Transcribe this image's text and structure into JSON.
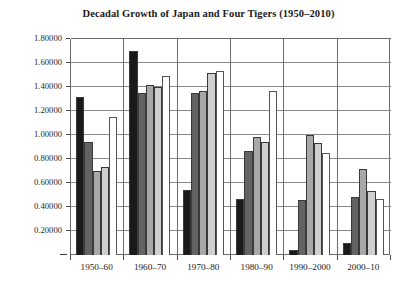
{
  "chart_data": {
    "type": "bar",
    "title": "Decadal Growth of Japan and Four Tigers (1950–2010)",
    "xlabel": "",
    "ylabel": "",
    "ylim": [
      0,
      1.8
    ],
    "grid": true,
    "legend_position": "none",
    "ytick_labels": [
      "1.80000",
      "1.60000",
      "1.40000",
      "1.20000",
      "1.00000",
      "0.80000",
      "0.60000",
      "0.40000",
      "0.20000",
      "–"
    ],
    "ytick_values": [
      1.8,
      1.6,
      1.4,
      1.2,
      1.0,
      0.8,
      0.6,
      0.4,
      0.2,
      0.0
    ],
    "categories": [
      "1950–60",
      "1960–70",
      "1970–80",
      "1980–90",
      "1990–2000",
      "2000–10"
    ],
    "series": [
      {
        "name": "series-1",
        "color": "#1a1a1a",
        "values": [
          1.32,
          1.7,
          0.54,
          0.47,
          0.04,
          0.1
        ]
      },
      {
        "name": "series-2",
        "color": "#636363",
        "values": [
          0.94,
          1.35,
          1.35,
          0.87,
          0.46,
          0.48
        ]
      },
      {
        "name": "series-3",
        "color": "#a8a8a8",
        "values": [
          0.7,
          1.42,
          1.37,
          0.98,
          1.0,
          0.72
        ]
      },
      {
        "name": "series-4",
        "color": "#cfcfcf",
        "values": [
          0.73,
          1.4,
          1.52,
          0.94,
          0.93,
          0.53
        ]
      },
      {
        "name": "series-5",
        "color": "#ffffff",
        "values": [
          1.15,
          1.49,
          1.53,
          1.37,
          0.85,
          0.47
        ]
      }
    ]
  }
}
